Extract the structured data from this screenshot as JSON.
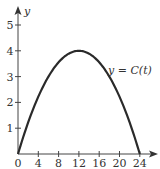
{
  "chart_data": {
    "type": "line",
    "title": "",
    "xlabel": "",
    "ylabel": "y",
    "xlim": [
      0,
      25
    ],
    "ylim": [
      0,
      5.5
    ],
    "x_ticks": [
      0,
      4,
      8,
      12,
      16,
      20,
      24
    ],
    "y_ticks": [
      1,
      2,
      3,
      4,
      5
    ],
    "x_tick_labels": [
      "0",
      "4",
      "8",
      "12",
      "16",
      "20",
      "24"
    ],
    "y_tick_labels": [
      "1",
      "2",
      "3",
      "4",
      "5"
    ],
    "grid": false,
    "series": [
      {
        "name": "y = C(t)",
        "x": [
          0,
          2,
          4,
          6,
          8,
          10,
          12,
          14,
          16,
          18,
          20,
          22,
          24
        ],
        "values": [
          0,
          1.22,
          2.22,
          3.0,
          3.56,
          3.89,
          4.0,
          3.89,
          3.56,
          3.0,
          2.22,
          1.22,
          0
        ]
      }
    ],
    "annotations": [
      {
        "text": "y = C(t)",
        "near_x": 19,
        "near_y": 3.3
      }
    ],
    "origin_label": "0"
  },
  "labels": {
    "y_axis": "y",
    "curve": "y = C(t)"
  }
}
